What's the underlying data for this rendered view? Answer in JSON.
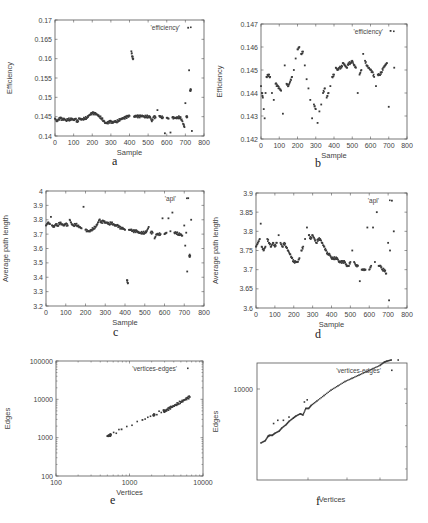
{
  "chart_data": [
    {
      "id": "a",
      "caption": "a",
      "type": "scatter",
      "xlabel": "Sample",
      "ylabel": "Efficiency",
      "legend": "'efficiency'",
      "xlim": [
        0,
        800
      ],
      "ylim": [
        0.14,
        0.17
      ],
      "xticks": [
        0,
        100,
        200,
        300,
        400,
        500,
        600,
        700,
        800
      ],
      "yticks": [
        0.14,
        0.145,
        0.15,
        0.155,
        0.16,
        0.165,
        0.17
      ],
      "ytick_labels": [
        "0.14",
        "0.145",
        "0.15",
        "0.155",
        "0.16",
        "0.165",
        "0.17"
      ],
      "frame": {
        "x": 55,
        "y": 20,
        "w": 149,
        "h": 116
      },
      "series": [
        {
          "name": "efficiency",
          "x": [
            0,
            10,
            20,
            30,
            40,
            50,
            60,
            70,
            80,
            90,
            100,
            110,
            120,
            130,
            140,
            150,
            160,
            170,
            180,
            190,
            200,
            210,
            220,
            230,
            240,
            250,
            260,
            270,
            280,
            290,
            300,
            310,
            320,
            330,
            340,
            350,
            360,
            370,
            380,
            390,
            400,
            410,
            415,
            420,
            425,
            430,
            440,
            450,
            460,
            470,
            480,
            490,
            500,
            510,
            520,
            530,
            540,
            550,
            560,
            570,
            580,
            590,
            600,
            610,
            620,
            630,
            640,
            650,
            660,
            670,
            680,
            690,
            695,
            700,
            705,
            710,
            715,
            720,
            725,
            730,
            735
          ],
          "y": [
            0.1445,
            0.1438,
            0.1443,
            0.1446,
            0.1442,
            0.1444,
            0.144,
            0.1444,
            0.1442,
            0.1445,
            0.1441,
            0.1444,
            0.1436,
            0.1445,
            0.1443,
            0.1444,
            0.1446,
            0.1447,
            0.1452,
            0.1456,
            0.1459,
            0.1458,
            0.1457,
            0.1454,
            0.145,
            0.1446,
            0.144,
            0.1434,
            0.1433,
            0.1436,
            0.1437,
            0.1434,
            0.1438,
            0.1437,
            0.144,
            0.1443,
            0.1445,
            0.1446,
            0.1448,
            0.145,
            0.1452,
            0.1619,
            0.1605,
            0.16,
            0.145,
            0.1451,
            0.1451,
            0.145,
            0.1451,
            0.1452,
            0.145,
            0.1451,
            0.145,
            0.145,
            0.1438,
            0.1449,
            0.1448,
            0.1467,
            0.1452,
            0.1449,
            0.1448,
            0.1407,
            0.1447,
            0.1445,
            0.1409,
            0.1448,
            0.1446,
            0.1447,
            0.1448,
            0.1449,
            0.1443,
            0.143,
            0.1423,
            0.1485,
            0.145,
            0.1449,
            0.168,
            0.157,
            0.1518,
            0.152,
            0.1413
          ]
        }
      ]
    },
    {
      "id": "b",
      "caption": "b",
      "type": "scatter",
      "xlabel": "Sample",
      "ylabel": "Efficiency",
      "legend": "'efficiency'",
      "xlim": [
        0,
        800
      ],
      "ylim": [
        0.142,
        0.147
      ],
      "xticks": [
        0,
        100,
        200,
        300,
        400,
        500,
        600,
        700,
        800
      ],
      "yticks": [
        0.142,
        0.143,
        0.144,
        0.145,
        0.146,
        0.147
      ],
      "ytick_labels": [
        "0.142",
        "0.143",
        "0.144",
        "0.145",
        "0.146",
        "0.147"
      ],
      "frame": {
        "x": 261,
        "y": 24,
        "w": 146,
        "h": 115
      },
      "series": [
        {
          "name": "efficiency",
          "x": [
            0,
            5,
            10,
            15,
            20,
            25,
            30,
            40,
            50,
            60,
            70,
            80,
            90,
            100,
            110,
            120,
            130,
            140,
            150,
            160,
            170,
            180,
            190,
            200,
            210,
            220,
            230,
            240,
            250,
            260,
            270,
            280,
            290,
            300,
            310,
            320,
            330,
            340,
            350,
            360,
            370,
            380,
            390,
            400,
            410,
            420,
            430,
            440,
            450,
            460,
            470,
            480,
            490,
            500,
            510,
            520,
            530,
            540,
            550,
            560,
            570,
            580,
            590,
            600,
            610,
            620,
            630,
            640,
            650,
            660,
            670,
            680,
            690,
            700,
            710,
            730
          ],
          "y": [
            0.1443,
            0.144,
            0.1438,
            0.1433,
            0.1429,
            0.144,
            0.1447,
            0.1448,
            0.1447,
            0.144,
            0.1437,
            0.1444,
            0.1443,
            0.1442,
            0.1441,
            0.1431,
            0.1452,
            0.1444,
            0.1443,
            0.1445,
            0.1447,
            0.145,
            0.1455,
            0.1459,
            0.146,
            0.1457,
            0.1458,
            0.1452,
            0.1446,
            0.1442,
            0.1437,
            0.1429,
            0.1435,
            0.1433,
            0.1427,
            0.1432,
            0.1435,
            0.144,
            0.1442,
            0.1438,
            0.144,
            0.1443,
            0.1447,
            0.1448,
            0.1451,
            0.145,
            0.1451,
            0.1451,
            0.1453,
            0.1452,
            0.1451,
            0.1453,
            0.1453,
            0.1454,
            0.1452,
            0.1451,
            0.144,
            0.1448,
            0.145,
            0.1457,
            0.1454,
            0.1452,
            0.1451,
            0.145,
            0.1449,
            0.1447,
            0.1443,
            0.1448,
            0.1448,
            0.1449,
            0.1451,
            0.1452,
            0.1453,
            0.1434,
            0.1467,
            0.1451
          ]
        }
      ]
    },
    {
      "id": "c",
      "caption": "c",
      "type": "scatter",
      "xlabel": "Sample",
      "ylabel": "Average path length",
      "legend": "'apl'",
      "xlim": [
        0,
        800
      ],
      "ylim": [
        3.2,
        4.0
      ],
      "xticks": [
        0,
        100,
        200,
        300,
        400,
        500,
        600,
        700,
        800
      ],
      "yticks": [
        3.2,
        3.3,
        3.4,
        3.5,
        3.6,
        3.7,
        3.8,
        3.9,
        4.0
      ],
      "ytick_labels": [
        "3.2",
        "3.3",
        "3.4",
        "3.5",
        "3.6",
        "3.7",
        "3.8",
        "3.9",
        "4"
      ],
      "frame": {
        "x": 46,
        "y": 191,
        "w": 158,
        "h": 115
      },
      "series": [
        {
          "name": "apl",
          "x": [
            0,
            10,
            20,
            25,
            30,
            40,
            50,
            60,
            70,
            80,
            90,
            100,
            110,
            120,
            130,
            140,
            150,
            160,
            170,
            180,
            190,
            200,
            210,
            220,
            230,
            240,
            250,
            260,
            270,
            280,
            290,
            300,
            310,
            320,
            330,
            340,
            350,
            360,
            370,
            380,
            390,
            400,
            410,
            415,
            420,
            430,
            440,
            450,
            460,
            470,
            480,
            490,
            500,
            510,
            520,
            530,
            540,
            550,
            560,
            570,
            580,
            590,
            600,
            610,
            620,
            630,
            640,
            650,
            660,
            670,
            680,
            690,
            700,
            705,
            710,
            715,
            720,
            725,
            730,
            735
          ],
          "y": [
            3.76,
            3.78,
            3.77,
            3.82,
            3.76,
            3.75,
            3.77,
            3.76,
            3.78,
            3.77,
            3.76,
            3.77,
            3.76,
            3.8,
            3.77,
            3.76,
            3.77,
            3.76,
            3.75,
            3.74,
            3.89,
            3.73,
            3.72,
            3.72,
            3.73,
            3.74,
            3.75,
            3.77,
            3.8,
            3.78,
            3.79,
            3.78,
            3.78,
            3.77,
            3.78,
            3.77,
            3.76,
            3.76,
            3.75,
            3.74,
            3.74,
            3.73,
            3.38,
            3.36,
            3.73,
            3.73,
            3.72,
            3.72,
            3.72,
            3.71,
            3.71,
            3.71,
            3.71,
            3.72,
            3.75,
            3.71,
            3.71,
            3.67,
            3.7,
            3.7,
            3.7,
            3.81,
            3.7,
            3.71,
            3.81,
            3.72,
            3.85,
            3.71,
            3.71,
            3.7,
            3.7,
            3.69,
            3.76,
            3.62,
            3.71,
            3.44,
            3.95,
            3.55,
            3.55,
            3.8
          ]
        }
      ]
    },
    {
      "id": "d",
      "caption": "d",
      "type": "scatter",
      "xlabel": "Sample",
      "ylabel": "Average path length",
      "legend": "'apl'",
      "xlim": [
        0,
        800
      ],
      "ylim": [
        3.6,
        3.9
      ],
      "xticks": [
        0,
        100,
        200,
        300,
        400,
        500,
        600,
        700,
        800
      ],
      "yticks": [
        3.6,
        3.65,
        3.7,
        3.75,
        3.8,
        3.85,
        3.9
      ],
      "ytick_labels": [
        "3.6",
        "3.65",
        "3.7",
        "3.75",
        "3.8",
        "3.85",
        "3.9"
      ],
      "frame": {
        "x": 256,
        "y": 193,
        "w": 151,
        "h": 115
      },
      "series": [
        {
          "name": "apl",
          "x": [
            0,
            10,
            20,
            25,
            30,
            40,
            50,
            60,
            70,
            80,
            90,
            100,
            110,
            120,
            130,
            140,
            150,
            160,
            170,
            180,
            190,
            200,
            210,
            220,
            230,
            240,
            250,
            260,
            270,
            280,
            290,
            300,
            310,
            320,
            330,
            340,
            350,
            360,
            370,
            380,
            390,
            400,
            410,
            420,
            430,
            440,
            450,
            460,
            470,
            480,
            490,
            500,
            510,
            520,
            530,
            540,
            550,
            560,
            570,
            580,
            590,
            600,
            610,
            620,
            630,
            640,
            650,
            660,
            670,
            680,
            690,
            700,
            705,
            710,
            720,
            730
          ],
          "y": [
            3.76,
            3.77,
            3.78,
            3.82,
            3.76,
            3.75,
            3.76,
            3.78,
            3.77,
            3.76,
            3.77,
            3.76,
            3.77,
            3.79,
            3.77,
            3.76,
            3.77,
            3.76,
            3.75,
            3.74,
            3.73,
            3.72,
            3.72,
            3.72,
            3.73,
            3.75,
            3.76,
            3.78,
            3.81,
            3.79,
            3.78,
            3.79,
            3.78,
            3.77,
            3.78,
            3.78,
            3.77,
            3.76,
            3.75,
            3.74,
            3.74,
            3.73,
            3.73,
            3.73,
            3.73,
            3.72,
            3.72,
            3.72,
            3.72,
            3.71,
            3.71,
            3.72,
            3.75,
            3.72,
            3.71,
            3.71,
            3.67,
            3.7,
            3.7,
            3.7,
            3.81,
            3.7,
            3.71,
            3.81,
            3.72,
            3.85,
            3.71,
            3.71,
            3.7,
            3.7,
            3.69,
            3.77,
            3.62,
            3.75,
            3.88,
            3.8
          ]
        }
      ]
    },
    {
      "id": "e",
      "caption": "e",
      "type": "scatter",
      "xlabel": "Vertices",
      "ylabel": "Edges",
      "legend": "'vertices-edges'",
      "xscale": "log",
      "yscale": "log",
      "xlim": [
        100,
        10000
      ],
      "ylim": [
        100,
        100000
      ],
      "xticks": [
        100,
        1000,
        10000
      ],
      "xtick_labels": [
        "100",
        "1000",
        "10000"
      ],
      "yticks": [
        100,
        1000,
        10000,
        100000
      ],
      "ytick_labels": [
        "100",
        "1000",
        "10000",
        "100000"
      ],
      "frame": {
        "x": 56,
        "y": 361,
        "w": 147,
        "h": 115
      },
      "series": [
        {
          "name": "vertices-edges",
          "x": [
            500,
            520,
            540,
            560,
            780,
            1500,
            2100,
            2200,
            2900,
            3000,
            3100,
            3300,
            3500,
            3700,
            4000,
            4300,
            4600,
            5000,
            5400,
            5800,
            6200,
            6600
          ],
          "y": [
            1100,
            1120,
            1150,
            1180,
            1650,
            2900,
            3900,
            4000,
            5200,
            4800,
            5000,
            5400,
            5800,
            6200,
            6700,
            7300,
            7900,
            8600,
            9300,
            10000,
            10800,
            11500
          ]
        }
      ]
    },
    {
      "id": "f",
      "caption": "f",
      "type": "scatter",
      "xlabel": "Vertices",
      "ylabel": "Edges",
      "legend": "'vertices-edges'",
      "xscale": "log",
      "yscale": "log",
      "yticks": [
        10000
      ],
      "ytick_labels": [
        "10000"
      ],
      "frame": {
        "x": 257,
        "y": 363,
        "w": 150,
        "h": 117
      },
      "series": [
        {
          "name": "vertices-edges",
          "x_frac": [
            0.0,
            0.03,
            0.05,
            0.06,
            0.08,
            0.1,
            0.13,
            0.15,
            0.18,
            0.2,
            0.23,
            0.25,
            0.28,
            0.3,
            0.32,
            0.34,
            0.36,
            0.4,
            0.45,
            0.5,
            0.55,
            0.6,
            0.65,
            0.7,
            0.75,
            0.8,
            0.85,
            0.88,
            0.9,
            0.93
          ],
          "y_frac": [
            0.23,
            0.25,
            0.29,
            0.3,
            0.3,
            0.32,
            0.34,
            0.37,
            0.4,
            0.43,
            0.46,
            0.48,
            0.5,
            0.49,
            0.55,
            0.55,
            0.58,
            0.62,
            0.67,
            0.72,
            0.76,
            0.8,
            0.83,
            0.86,
            0.89,
            0.92,
            0.95,
            0.98,
            0.99,
            1.0
          ],
          "outliers_frac": [
            [
              0.09,
              0.41
            ],
            [
              0.12,
              0.44
            ],
            [
              0.16,
              0.44
            ],
            [
              0.2,
              0.47
            ],
            [
              0.31,
              0.61
            ],
            [
              0.33,
              0.63
            ],
            [
              0.98,
              1.0
            ]
          ]
        }
      ]
    }
  ]
}
